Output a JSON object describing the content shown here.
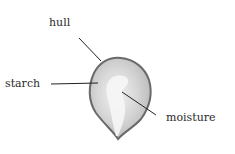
{
  "diagram": {
    "labels": {
      "hull": "hull",
      "starch": "starch",
      "moisture": "moisture"
    },
    "colors": {
      "hull_outline": "#6a6a6a",
      "starch_fill": "#c9c9c9",
      "moisture_fill": "#f4f4f4",
      "leader_line": "#222222",
      "text": "#2a2a2a"
    }
  }
}
